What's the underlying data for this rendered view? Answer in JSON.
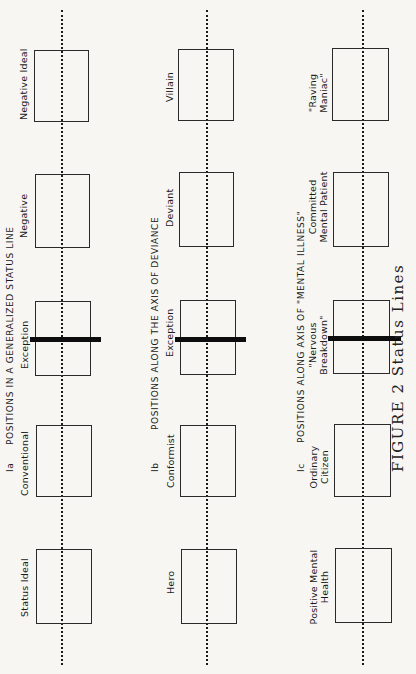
{
  "figure": {
    "caption": "FIGURE 2 Status Lines"
  },
  "panels": [
    {
      "id": "Ia",
      "tag": "Ia",
      "heading": "POSITIONS IN A GENERALIZED STATUS LINE",
      "positions": [
        {
          "label": "Status Ideal"
        },
        {
          "label": "Conventional"
        },
        {
          "label": "Exception",
          "marked": true
        },
        {
          "label": "Negative"
        },
        {
          "label": "Negative Ideal"
        }
      ]
    },
    {
      "id": "Ib",
      "tag": "Ib",
      "heading": "POSITIONS ALONG THE AXIS OF DEVIANCE",
      "positions": [
        {
          "label": "Hero"
        },
        {
          "label": "Conformist"
        },
        {
          "label": "Exception",
          "marked": true
        },
        {
          "label": "Deviant"
        },
        {
          "label": "Villain"
        }
      ]
    },
    {
      "id": "Ic",
      "tag": "Ic",
      "heading": "POSITIONS ALONG AXIS OF \"MENTAL ILLNESS\"",
      "positions": [
        {
          "label": "Positive Mental",
          "label2": "Health"
        },
        {
          "label": "Ordinary",
          "label2": "Citizen"
        },
        {
          "label": "\"Nervous",
          "label2": "Breakdown\"",
          "marked": true
        },
        {
          "label": "Committed",
          "label2": "Mental Patient"
        },
        {
          "label": "\"Raving",
          "label2": "Maniac\""
        }
      ]
    }
  ],
  "colors": {
    "ink": "#1a1a1a",
    "paper": "#f7f6f3",
    "marker_bar": "#0d0d0d"
  }
}
